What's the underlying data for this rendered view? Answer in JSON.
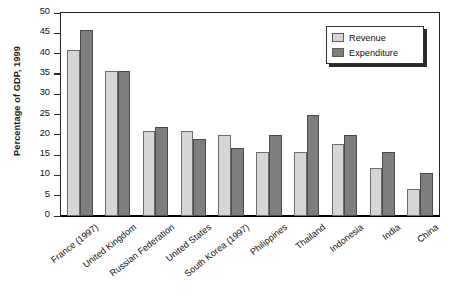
{
  "chart_data": {
    "type": "bar",
    "title": "",
    "xlabel": "",
    "ylabel": "Percentage of GDP, 1999",
    "ylim": [
      0,
      50
    ],
    "yticks": [
      0,
      5,
      10,
      15,
      20,
      25,
      30,
      35,
      40,
      45,
      50
    ],
    "ytick_labels": [
      "0",
      "5",
      "10",
      "15",
      "20",
      "25",
      "30",
      "35",
      "40",
      "45",
      "50"
    ],
    "grid": false,
    "legend_position": "upper right",
    "categories": [
      "France (1997)",
      "United Kingdom",
      "Russian Federation",
      "United States",
      "South Korea (1997)",
      "Philippines",
      "Thailand",
      "Indonesia",
      "India",
      "China"
    ],
    "series": [
      {
        "name": "Revenue",
        "color": "#d6d6d6",
        "values": [
          41,
          35.8,
          21,
          21,
          19.9,
          15.8,
          15.8,
          17.8,
          11.9,
          6.7
        ]
      },
      {
        "name": "Expenditure",
        "color": "#7e7e7e",
        "values": [
          45.9,
          35.8,
          22,
          18.9,
          16.7,
          19.9,
          24.8,
          19.9,
          15.7,
          10.7
        ]
      }
    ]
  },
  "legend": {
    "items": [
      {
        "label": "Revenue",
        "swatch": "revenue"
      },
      {
        "label": "Expenditure",
        "swatch": "expenditure"
      }
    ]
  },
  "artifacts": {
    "title_crop": "",
    "source_note": ""
  }
}
